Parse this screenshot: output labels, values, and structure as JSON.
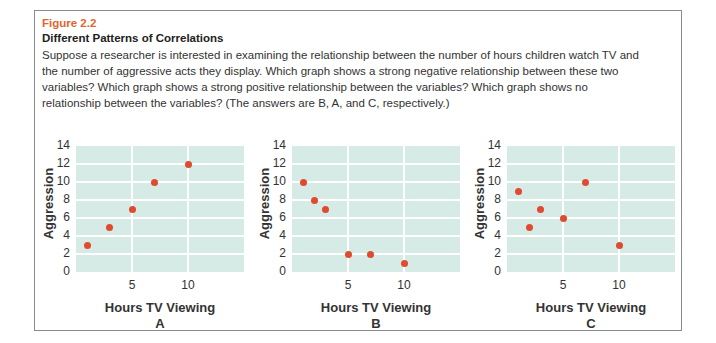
{
  "figure": {
    "number": "Figure 2.2",
    "title": "Different Patterns of Correlations",
    "caption": "Suppose a researcher is interested in examining the relationship between the number of hours children watch TV and the number of aggressive acts they display. Which graph shows a strong negative relationship between these two variables? Which graph shows a strong positive relationship between the variables? Which graph shows no relationship between the variables? (The answers are B, A, and C, respectively.)"
  },
  "colors": {
    "accent": "#e0652f",
    "point": "#e04a2f",
    "plot_bg": "#d6ebe6",
    "grid": "#ffffff"
  },
  "chart_data": [
    {
      "type": "scatter",
      "panel": "A",
      "xlabel": "Hours TV Viewing",
      "ylabel": "Aggression",
      "x": [
        1,
        3,
        5,
        7,
        10
      ],
      "y": [
        3,
        5,
        7,
        10,
        12
      ],
      "xlim": [
        0,
        15
      ],
      "ylim": [
        0,
        14
      ],
      "xticks": [
        "5",
        "10"
      ],
      "yticks": [
        "0",
        "2",
        "4",
        "6",
        "8",
        "10",
        "12",
        "14"
      ],
      "grid": true
    },
    {
      "type": "scatter",
      "panel": "B",
      "xlabel": "Hours TV Viewing",
      "ylabel": "Aggression",
      "x": [
        1,
        2,
        3,
        5,
        7,
        10
      ],
      "y": [
        10,
        8,
        7,
        2,
        2,
        1
      ],
      "xlim": [
        0,
        15
      ],
      "ylim": [
        0,
        14
      ],
      "xticks": [
        "5",
        "10"
      ],
      "yticks": [
        "0",
        "2",
        "4",
        "6",
        "8",
        "10",
        "12",
        "14"
      ],
      "grid": true
    },
    {
      "type": "scatter",
      "panel": "C",
      "xlabel": "Hours TV Viewing",
      "ylabel": "Aggression",
      "x": [
        1,
        2,
        3,
        5,
        7,
        10
      ],
      "y": [
        9,
        5,
        7,
        6,
        10,
        3
      ],
      "xlim": [
        0,
        15
      ],
      "ylim": [
        0,
        14
      ],
      "xticks": [
        "5",
        "10"
      ],
      "yticks": [
        "0",
        "2",
        "4",
        "6",
        "8",
        "10",
        "12",
        "14"
      ],
      "grid": true
    }
  ]
}
